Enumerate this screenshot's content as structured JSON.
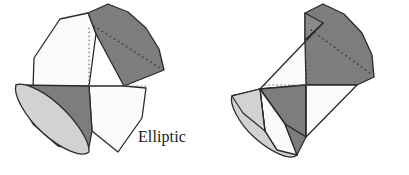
{
  "figure": {
    "background_color": "#ffffff",
    "panels": [
      {
        "id": "elliptic",
        "caption": "Elliptic",
        "description": "Double cone cut by a plane producing an elliptical cross-section",
        "parts": [
          {
            "name": "upper-right-cone-nappe",
            "fill": "#7d7d7d",
            "kind": "cone-surface"
          },
          {
            "name": "upper-left-cutting-plane",
            "fill": "#fbfbfb",
            "kind": "plane"
          },
          {
            "name": "lower-right-cutting-plane",
            "fill": "#fbfbfb",
            "kind": "plane"
          },
          {
            "name": "lower-left-cone-nappe",
            "fill": "#7d7d7d",
            "kind": "cone-surface"
          },
          {
            "name": "lower-left-cone-base-ellipse",
            "fill": "#d2d2d2",
            "kind": "ellipse-face"
          }
        ]
      },
      {
        "id": "hyperbolic",
        "caption": "Hyperbolic",
        "description": "Double cone cut by a plane producing a hyperbolic cross-section",
        "parts": [
          {
            "name": "upper-right-cone-nappe",
            "fill": "#7d7d7d",
            "kind": "cone-surface"
          },
          {
            "name": "upper-cutting-plane",
            "fill": "#fbfbfb",
            "kind": "plane"
          },
          {
            "name": "center-cone-wedge",
            "fill": "#7d7d7d",
            "kind": "cone-surface"
          },
          {
            "name": "lower-left-cone-nappe",
            "fill": "#7d7d7d",
            "kind": "cone-surface"
          },
          {
            "name": "lower-left-cone-base-ellipse",
            "fill": "#d2d2d2",
            "kind": "ellipse-face"
          },
          {
            "name": "lower-cutting-plane",
            "fill": "#fbfbfb",
            "kind": "plane"
          }
        ]
      }
    ],
    "colors": {
      "dark_gray": "#7d7d7d",
      "mid_gray": "#8a8a8a",
      "light_gray": "#d2d2d2",
      "pale_gray": "#e2e2e2",
      "white_face": "#fbfbfb",
      "outline": "#2a2a2a",
      "hidden_line": "#555555",
      "text": "#1a1a1a"
    }
  }
}
